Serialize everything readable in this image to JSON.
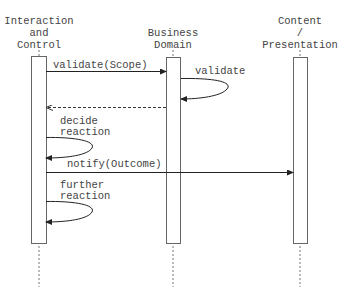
{
  "diagram": {
    "type": "sequence",
    "participants": [
      {
        "id": "ic",
        "lines": [
          "Interaction",
          "and",
          "Control"
        ],
        "x": 39
      },
      {
        "id": "bd",
        "lines": [
          "Business",
          "Domain"
        ],
        "x": 173
      },
      {
        "id": "cp",
        "lines": [
          "Content",
          "/",
          "Presentation"
        ],
        "x": 300
      }
    ],
    "messages": [
      {
        "id": "m1",
        "kind": "call",
        "from": "ic",
        "to": "bd",
        "label": "validate(Scope)",
        "y": 71
      },
      {
        "id": "m2",
        "kind": "self",
        "on": "bd",
        "label": "validate",
        "y1": 78,
        "y2": 99
      },
      {
        "id": "m3",
        "kind": "return",
        "from": "bd",
        "to": "ic",
        "label": "",
        "y": 107
      },
      {
        "id": "m4",
        "kind": "self",
        "on": "ic",
        "label_lines": [
          "decide",
          "reaction"
        ],
        "y1": 137,
        "y2": 158
      },
      {
        "id": "m5",
        "kind": "call",
        "from": "ic",
        "to": "cp",
        "label": "notify(Outcome)",
        "y": 172
      },
      {
        "id": "m6",
        "kind": "self",
        "on": "ic",
        "label_lines": [
          "further",
          "reaction"
        ],
        "y1": 201,
        "y2": 222
      }
    ]
  },
  "labels": {
    "p_ic_1": "Interaction",
    "p_ic_2": "and",
    "p_ic_3": "Control",
    "p_bd_1": "Business",
    "p_bd_2": "Domain",
    "p_cp_1": "Content",
    "p_cp_2": "/",
    "p_cp_3": "Presentation",
    "m1": "validate(Scope)",
    "m2": "validate",
    "m4_1": "decide",
    "m4_2": "reaction",
    "m5": "notify(Outcome)",
    "m6_1": "further",
    "m6_2": "reaction"
  },
  "colors": {
    "line": "#222222",
    "box": "#666666",
    "text": "#444444",
    "background": "#ffffff"
  }
}
